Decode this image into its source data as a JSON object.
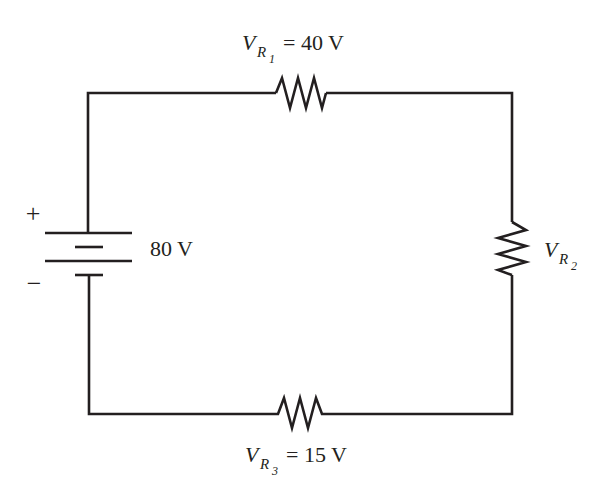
{
  "diagram": {
    "type": "series-circuit",
    "source": {
      "voltage_label": "80 V",
      "positive_terminal": "+",
      "negative_terminal": "−"
    },
    "resistors": [
      {
        "id": "R1",
        "var": "V",
        "sub": "R",
        "subsub": "1",
        "value_text": "= 40 V",
        "position": "top"
      },
      {
        "id": "R2",
        "var": "V",
        "sub": "R",
        "subsub": "2",
        "value_text": "",
        "position": "right"
      },
      {
        "id": "R3",
        "var": "V",
        "sub": "R",
        "subsub": "3",
        "value_text": "= 15 V",
        "position": "bottom"
      }
    ],
    "colors": {
      "wire": "#231f20",
      "background": "#ffffff"
    }
  }
}
